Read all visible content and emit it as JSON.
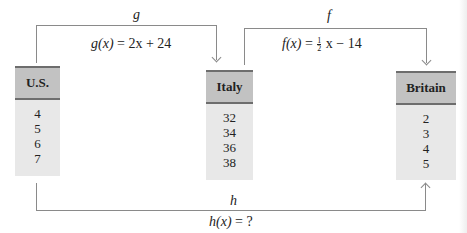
{
  "diagram": {
    "nodes": [
      {
        "id": "us",
        "label": "U.S.",
        "values": [
          "4",
          "5",
          "6",
          "7"
        ]
      },
      {
        "id": "italy",
        "label": "Italy",
        "values": [
          "32",
          "34",
          "36",
          "38"
        ]
      },
      {
        "id": "britain",
        "label": "Britain",
        "values": [
          "2",
          "3",
          "4",
          "5"
        ]
      }
    ],
    "edges": [
      {
        "from": "us",
        "to": "italy",
        "label": "g",
        "formula_name": "g(x)",
        "formula_rhs": "= 2x + 24"
      },
      {
        "from": "italy",
        "to": "britain",
        "label": "f",
        "formula_name": "f(x)",
        "formula_rhs_pre": "=",
        "fraction_num": "1",
        "fraction_den": "2",
        "formula_rhs_post": "x − 14"
      },
      {
        "from": "us",
        "to": "britain",
        "label": "h",
        "formula_name": "h(x)",
        "formula_rhs": "= ?"
      }
    ]
  },
  "colors": {
    "box_fill": "#e8e8e8",
    "header_fill": "#c2c2c2",
    "header_border": "#6d6d6d",
    "connector": "#8a8a8a"
  }
}
